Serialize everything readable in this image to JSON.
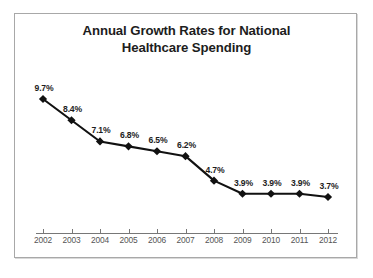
{
  "chart_data": {
    "type": "line",
    "title": "Annual Growth Rates for National Healthcare Spending",
    "title_lines": [
      "Annual Growth Rates for National",
      "Healthcare Spending"
    ],
    "xlabel": "",
    "ylabel": "",
    "categories": [
      "2002",
      "2003",
      "2004",
      "2005",
      "2006",
      "2007",
      "2008",
      "2009",
      "2010",
      "2011",
      "2012"
    ],
    "values": [
      9.7,
      8.4,
      7.1,
      6.8,
      6.5,
      6.2,
      4.7,
      3.9,
      3.9,
      3.9,
      3.7
    ],
    "point_labels": [
      "9.7%",
      "8.4%",
      "7.1%",
      "6.8%",
      "6.5%",
      "6.2%",
      "4.7%",
      "3.9%",
      "3.9%",
      "3.9%",
      "3.7%"
    ],
    "ylim": [
      3.0,
      10.4
    ],
    "grid": false,
    "legend": false,
    "marker": "diamond",
    "series_color": "#111111",
    "label_color": "#1d1d1d",
    "axis_color": "#777777",
    "tick_label_color": "#555555",
    "frame_color": "#a8a8a8",
    "background": "#ffffff"
  }
}
